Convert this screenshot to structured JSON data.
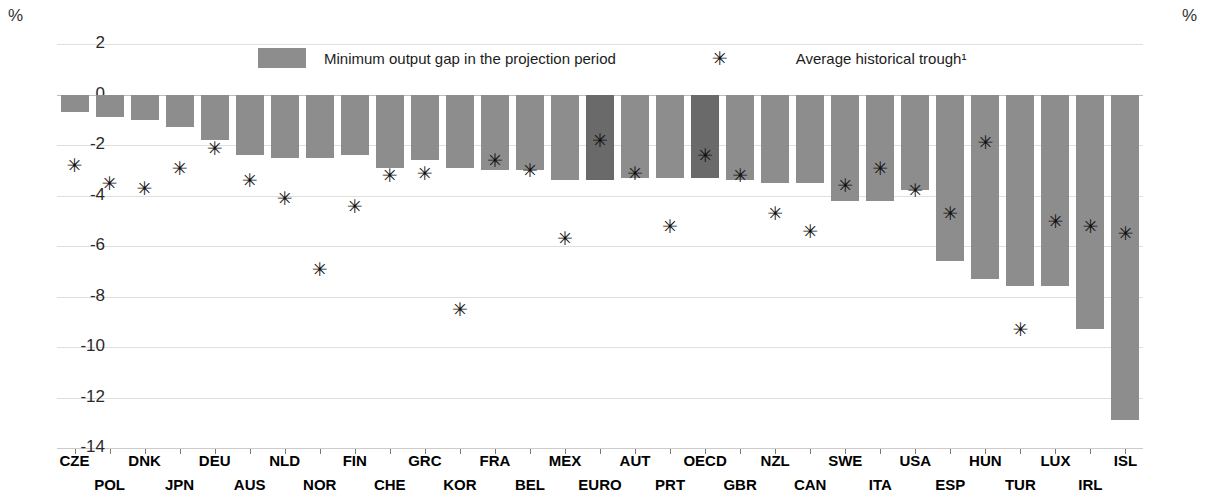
{
  "axis": {
    "unit_left": "%",
    "unit_right": "%",
    "yticks": [
      "2",
      "0",
      "-2",
      "-4",
      "-6",
      "-8",
      "-10",
      "-12",
      "-14"
    ]
  },
  "legend": {
    "bar_label": "Minimum output gap in the projection period",
    "star_glyph": "✳",
    "star_label": "Average historical trough¹"
  },
  "chart_data": {
    "type": "bar",
    "title": "",
    "xlabel": "",
    "ylabel": "%",
    "ylim": [
      -14,
      2
    ],
    "grid": true,
    "legend_position": "top-center",
    "categories": [
      "CZE",
      "POL",
      "DNK",
      "JPN",
      "DEU",
      "AUS",
      "NLD",
      "NOR",
      "FIN",
      "CHE",
      "GRC",
      "KOR",
      "FRA",
      "BEL",
      "MEX",
      "EURO",
      "AUT",
      "PRT",
      "OECD",
      "GBR",
      "NZL",
      "CAN",
      "SWE",
      "ITA",
      "USA",
      "ESP",
      "HUN",
      "TUR",
      "LUX",
      "IRL",
      "ISL"
    ],
    "highlighted_categories": [
      "EURO",
      "OECD"
    ],
    "series": [
      {
        "name": "Minimum output gap in the projection period",
        "type": "bar",
        "values": [
          -0.7,
          -0.9,
          -1.0,
          -1.3,
          -1.8,
          -2.4,
          -2.5,
          -2.5,
          -2.4,
          -2.9,
          -2.6,
          -2.9,
          -3.0,
          -3.0,
          -3.4,
          -3.4,
          -3.3,
          -3.3,
          -3.3,
          -3.4,
          -3.5,
          -3.5,
          -4.2,
          -4.2,
          -3.8,
          -6.6,
          -7.3,
          -7.6,
          -7.6,
          -9.3,
          -12.9
        ]
      },
      {
        "name": "Average historical trough¹",
        "type": "scatter",
        "values": [
          -2.8,
          -3.5,
          -3.7,
          -2.9,
          -2.1,
          -3.4,
          -4.1,
          -6.9,
          -4.4,
          -3.2,
          -3.1,
          -8.5,
          -2.6,
          -3.0,
          -5.7,
          -1.8,
          -3.1,
          -5.2,
          -2.4,
          -3.2,
          -4.7,
          -5.4,
          -3.6,
          -2.9,
          -3.8,
          -4.7,
          -1.9,
          -9.3,
          -5.0,
          -5.2,
          -5.5
        ]
      }
    ]
  }
}
